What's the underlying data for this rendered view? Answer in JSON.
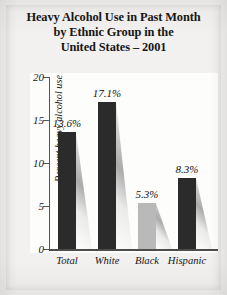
{
  "title": {
    "line1": "Heavy Alcohol Use in Past Month",
    "line2": "by Ethnic Group in the",
    "line3": "United States – 2001"
  },
  "colors": {
    "page_background": "#efeeec",
    "plot_background": "#fdfdfc",
    "bar_dark": "#2b2b2b",
    "bar_light": "#b9b9b9",
    "axis": "#4d4d4d",
    "text": "#161616"
  },
  "chart_data": {
    "type": "bar",
    "title": "Heavy Alcohol Use in Past Month by Ethnic Group in the United States – 2001",
    "xlabel": "",
    "ylabel": "Percent heavy alcohol use",
    "ylim": [
      0,
      20
    ],
    "yticks": [
      "0",
      "5",
      "10",
      "15",
      "20"
    ],
    "ytick_values": [
      0,
      5,
      10,
      15,
      20
    ],
    "grid": false,
    "legend": "none",
    "categories": [
      "Total",
      "White",
      "Black",
      "Hispanic"
    ],
    "values": [
      13.6,
      17.1,
      5.3,
      8.3
    ],
    "data_labels": [
      "13.6%",
      "17.1%",
      "5.3%",
      "8.3%"
    ],
    "bar_colors": [
      "#2b2b2b",
      "#2b2b2b",
      "#b9b9b9",
      "#2b2b2b"
    ]
  }
}
